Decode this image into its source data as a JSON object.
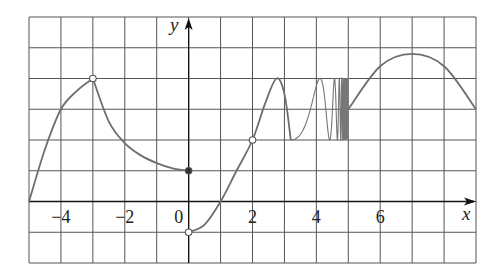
{
  "chart_data": {
    "type": "line",
    "title": "",
    "xlabel": "x",
    "ylabel": "y",
    "xlim": [
      -5,
      9
    ],
    "ylim": [
      -2,
      6
    ],
    "grid": true,
    "x_tick_labels": [
      {
        "value": -4,
        "label": "−4"
      },
      {
        "value": -2,
        "label": "−2"
      },
      {
        "value": 0,
        "label": "0"
      },
      {
        "value": 2,
        "label": "2"
      },
      {
        "value": 4,
        "label": "4"
      },
      {
        "value": 6,
        "label": "6"
      }
    ],
    "pieces": [
      {
        "name": "left-rising-arc",
        "points": [
          [
            -5,
            0
          ],
          [
            -4.5,
            1.7
          ],
          [
            -4,
            3
          ],
          [
            -3.5,
            3.6
          ],
          [
            -3,
            4
          ]
        ],
        "end": "open"
      },
      {
        "name": "decreasing-arc",
        "points": [
          [
            -3,
            4
          ],
          [
            -2.5,
            2.6
          ],
          [
            -2,
            1.9
          ],
          [
            -1.5,
            1.5
          ],
          [
            -1,
            1.25
          ],
          [
            -0.5,
            1.08
          ],
          [
            0,
            1
          ]
        ],
        "end": "closed"
      },
      {
        "name": "rising-from-zero",
        "points": [
          [
            0,
            -1
          ],
          [
            0.5,
            -0.75
          ],
          [
            1,
            0
          ],
          [
            1.5,
            1
          ],
          [
            2,
            2
          ],
          [
            2.4,
            3.2
          ],
          [
            2.75,
            4
          ],
          [
            3,
            3.5
          ],
          [
            3.2,
            2
          ]
        ],
        "start": "open",
        "hole_at": [
          2,
          2
        ]
      },
      {
        "name": "oscillation",
        "x_range": [
          3.2,
          5
        ],
        "y_range": [
          2,
          4
        ],
        "description": "sin-like oscillation between y=2 and y=4 with increasing frequency as x approaches 5"
      },
      {
        "name": "right-arc",
        "points": [
          [
            5,
            3
          ],
          [
            6,
            4.4
          ],
          [
            7,
            4.8
          ],
          [
            8,
            4.4
          ],
          [
            9,
            3
          ]
        ]
      }
    ],
    "special_points": [
      {
        "x": -3,
        "y": 4,
        "type": "open"
      },
      {
        "x": 0,
        "y": 1,
        "type": "closed"
      },
      {
        "x": 0,
        "y": -1,
        "type": "open"
      },
      {
        "x": 2,
        "y": 2,
        "type": "open"
      }
    ],
    "colors": {
      "grid": "#555555",
      "curve": "#6e6e6e",
      "axis": "#111111"
    }
  }
}
